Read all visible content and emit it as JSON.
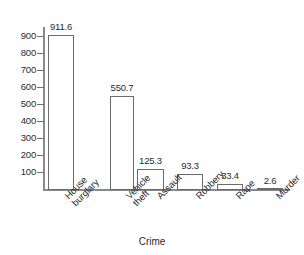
{
  "chart_data": {
    "type": "bar",
    "title": "",
    "subtitle": "",
    "xlabel": "Crime",
    "ylabel": "",
    "categories": [
      "House\nburglary",
      "Vehicle\ntheft",
      "Assault",
      "Robbery",
      "Rape",
      "Murder"
    ],
    "values": [
      911.6,
      550.7,
      125.3,
      93.3,
      33.4,
      2.6
    ],
    "value_labels": [
      "911.6",
      "550.7",
      "125.3",
      "93.3",
      "33.4",
      "2.6"
    ],
    "ylim": [
      0,
      950
    ],
    "yticks": [
      100,
      200,
      300,
      400,
      500,
      600,
      700,
      800,
      900
    ],
    "ytick_labels": [
      "100",
      "200",
      "300",
      "400",
      "500",
      "600",
      "700",
      "800",
      "900"
    ],
    "grid": false,
    "legend": null,
    "bar_fill_color": "#ffffff",
    "bar_border_color": "#6b6b6b",
    "axis_color": "#8a8a8a",
    "text_color": "#2b2b2b"
  }
}
